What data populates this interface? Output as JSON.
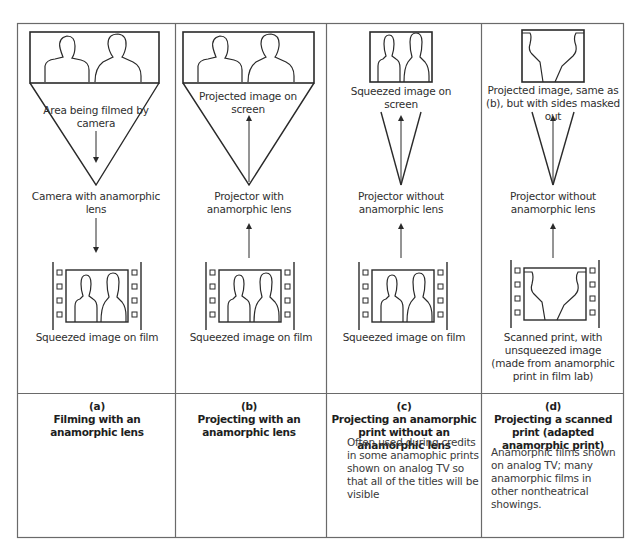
{
  "diagram": {
    "type": "comparison-table-of-film-projection-methods",
    "columns": [
      {
        "id": "a",
        "top_label": "Area being filmed by camera",
        "middle_label": "Camera with anamorphic lens",
        "bottom_label": "Squeezed image on film",
        "arrow_direction": "down",
        "caption_letter": "(a)",
        "caption_title": "Filming with an anamorphic lens",
        "description": ""
      },
      {
        "id": "b",
        "top_label": "Projected image on screen",
        "middle_label": "Projector with anamorphic lens",
        "bottom_label": "Squeezed image on film",
        "arrow_direction": "up",
        "caption_letter": "(b)",
        "caption_title": "Projecting with an anamorphic lens",
        "description": ""
      },
      {
        "id": "c",
        "top_label": "Squeezed image on screen",
        "middle_label": "Projector without anamorphic lens",
        "bottom_label": "Squeezed image on film",
        "arrow_direction": "up",
        "caption_letter": "(c)",
        "caption_title": "Projecting an anamorphic print without an anamorphic lens",
        "description": "Often used during credits in some anamophic prints shown on analog TV so that all of the titles will be visible"
      },
      {
        "id": "d",
        "top_label": "Projected image, same as (b), but with sides masked out",
        "middle_label": "Projector without anamorphic lens",
        "bottom_label": "Scanned print, with unsqueezed image (made from anamorphic print in film lab)",
        "arrow_direction": "up",
        "caption_letter": "(d)",
        "caption_title": "Projecting a scanned print (adapted anamorphic print)",
        "description": "Anamorphic films shown on analog TV; many anamorphic films in other nontheatrical showings."
      }
    ],
    "colors": {
      "line": "#2a2a2a",
      "border": "#6a6a6a",
      "background": "#ffffff"
    }
  }
}
